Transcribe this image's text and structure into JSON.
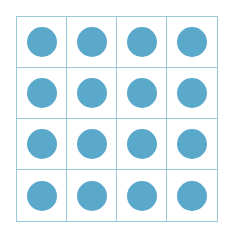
{
  "diagram": {
    "rows": 4,
    "columns": 4,
    "total_dots": 16,
    "dot_color": "#5aa9cb",
    "grid_line_color": "#9cc8dc"
  }
}
